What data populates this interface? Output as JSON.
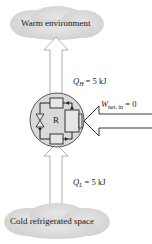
{
  "diagram": {
    "type": "reversible-refrigerator-energy-flow",
    "top_reservoir": {
      "label": "Warm environment",
      "color": "#dcdcdc"
    },
    "bottom_reservoir": {
      "label": "Cold refrigerated space",
      "color": "#dcdcdc"
    },
    "device": {
      "label": "R",
      "fill": "#d9d9d9"
    },
    "heat_out": {
      "symbol": "Q",
      "subscript": "H",
      "value": "= 5 kJ"
    },
    "heat_in": {
      "symbol": "Q",
      "subscript": "L",
      "value": "= 5 kJ"
    },
    "work_in": {
      "symbol": "W",
      "subscript": "net, in",
      "value": "= 0"
    }
  }
}
